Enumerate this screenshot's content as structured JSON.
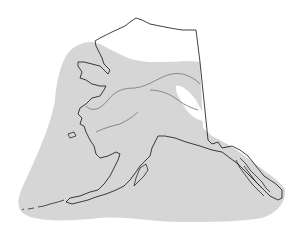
{
  "map": {
    "subject": "Alaska",
    "type": "species range map",
    "colors": {
      "background": "#ffffff",
      "range_fill": "#d6d6d6",
      "outline": "#111111",
      "rivers": "#888888"
    },
    "layers": [
      {
        "name": "range",
        "description": "gray shaded distribution area covering most of the state and adjacent coastal waters"
      },
      {
        "name": "excluded-north-slope",
        "description": "unshaded Arctic north slope"
      },
      {
        "name": "excluded-interior-patch",
        "description": "unshaded patch in eastern interior"
      },
      {
        "name": "coastline",
        "description": "black outline of Alaska coast and islands"
      },
      {
        "name": "rivers",
        "description": "gray lines for major rivers (Yukon, Kuskokwim, Porcupine)"
      }
    ]
  }
}
